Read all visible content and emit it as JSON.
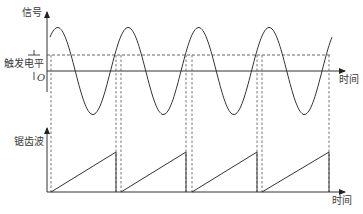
{
  "diagram": {
    "type": "oscilloscope trigger timing diagram",
    "top_panel": {
      "y_axis_label": "信号",
      "x_axis_label": "时间",
      "origin_label": "O",
      "trigger_level_label": "触发电平",
      "waveform": "sine",
      "periods_shown": 4
    },
    "bottom_panel": {
      "y_axis_label": "锯齿波",
      "x_axis_label": "时间",
      "waveform": "sawtooth",
      "ramps_shown": 4
    }
  },
  "geometry": {
    "sine": {
      "x0": 47,
      "x_end": 332,
      "period": 70.5,
      "mid_y": 71,
      "amp": 43.5,
      "phase_x": 40
    },
    "trigger_y": 55,
    "rising_triggers_x": [
      51,
      121,
      192,
      262
    ],
    "ramp_ends_x": [
      116,
      186,
      257,
      329
    ],
    "saw_baseline_y": 192,
    "saw_top_y": 152
  },
  "colors": {
    "line": "#3a3a3a",
    "dash": "#555555",
    "background": "#ffffff"
  }
}
